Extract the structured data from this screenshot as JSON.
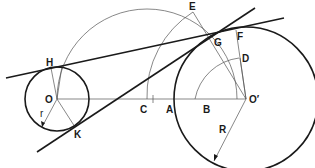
{
  "diagram": {
    "type": "geometric-construction",
    "colors": {
      "stroke": "#1a1a1a",
      "construction": "#555555",
      "background": "#ffffff"
    },
    "labels": {
      "E": "E",
      "G": "G",
      "F": "F",
      "D": "D",
      "H": "H",
      "O": "O",
      "C": "C",
      "A": "A",
      "B": "B",
      "O_prime": "O′",
      "r": "r",
      "K": "K",
      "R": "R"
    },
    "elements": {
      "small_circle": {
        "center": "O",
        "radius_label": "r"
      },
      "large_circle": {
        "center": "O′",
        "radius_label": "R"
      },
      "construction_semicircle": {
        "center": "C",
        "through": [
          "O",
          "O′"
        ]
      },
      "tangent_lines": [
        "H–G (external)",
        "K–G (internal)"
      ]
    }
  }
}
